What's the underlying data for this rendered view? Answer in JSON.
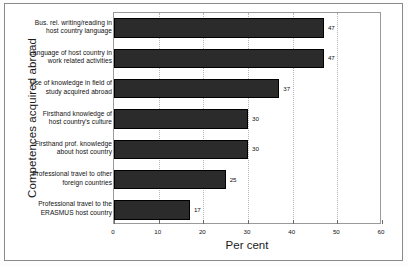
{
  "chart_data": {
    "type": "bar",
    "orientation": "horizontal",
    "title": "",
    "xlabel": "Per cent",
    "ylabel": "Competences acquired abroad",
    "xlim": [
      0,
      60
    ],
    "xticks": [
      0,
      10,
      20,
      30,
      40,
      50,
      60
    ],
    "xtick_labels": [
      "0",
      "10",
      "20",
      "30",
      "40",
      "50",
      "60"
    ],
    "grid": "vertical-dotted",
    "legend": null,
    "bar_color": "#2b2b2b",
    "categories": [
      "Bus. rel. writing/reading in host country language",
      "Language of host country in work related activities",
      "Use of knowledge in field of study acquired abroad",
      "Firsthand knowledge of host country's culture",
      "Firsthand prof. knowledge about host country",
      "Professional travel to other foreign countries",
      "Professional travel to the ERASMUS host country"
    ],
    "category_lines": [
      [
        "Bus. rel. writing/reading in",
        "host country language"
      ],
      [
        "Language of host country in",
        "work related activities"
      ],
      [
        "Use of knowledge in field of",
        "study acquired abroad"
      ],
      [
        "Firsthand knowledge of",
        "host country's culture"
      ],
      [
        "Firsthand prof. knowledge",
        "about host country"
      ],
      [
        "Professional travel to other",
        "foreign countries"
      ],
      [
        "Professional travel to the",
        "ERASMUS host country"
      ]
    ],
    "values": [
      47,
      47,
      37,
      30,
      30,
      25,
      17
    ],
    "value_labels": [
      "47",
      "47",
      "37",
      "30",
      "30",
      "25",
      "17"
    ]
  }
}
